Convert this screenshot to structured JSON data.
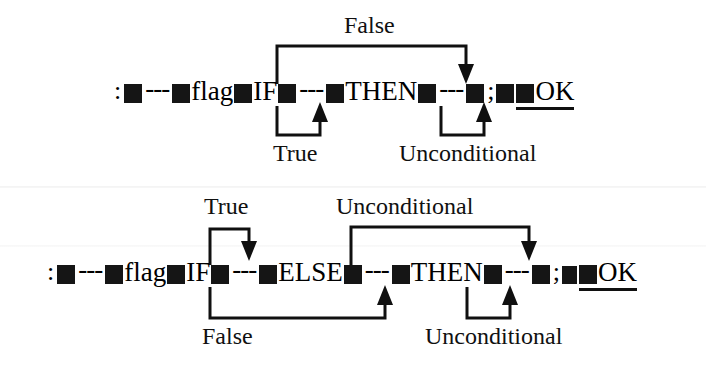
{
  "figure": {
    "kind": "forth-control-flow-diagram",
    "ink_color": "#101010",
    "background_color": "#ffffff"
  },
  "diagrams": [
    {
      "id": "if-then",
      "code_tokens": [
        {
          "type": "symbol",
          "text": ":"
        },
        {
          "type": "block",
          "text": ""
        },
        {
          "type": "dashes",
          "text": "---"
        },
        {
          "type": "block",
          "text": ""
        },
        {
          "type": "word",
          "text": "flag"
        },
        {
          "type": "block",
          "text": ""
        },
        {
          "type": "word",
          "text": "IF"
        },
        {
          "type": "block",
          "text": ""
        },
        {
          "type": "dashes",
          "text": "---"
        },
        {
          "type": "block",
          "text": ""
        },
        {
          "type": "word",
          "text": "THEN"
        },
        {
          "type": "block",
          "text": ""
        },
        {
          "type": "dashes",
          "text": "---"
        },
        {
          "type": "block",
          "text": ""
        },
        {
          "type": "symbol",
          "text": ";"
        },
        {
          "type": "block",
          "text": ""
        },
        {
          "type": "block",
          "text": ""
        },
        {
          "type": "word",
          "text": "OK"
        }
      ],
      "code_line_text": ": ■---■flag■IF■---■THEN■---■; ■ ■OK",
      "branches": [
        {
          "label": "False",
          "position": "above",
          "from": "after-IF",
          "to": "after-THEN",
          "direction": "forward-down-arrow"
        },
        {
          "label": "True",
          "position": "below",
          "from": "before-IF",
          "to": "after-IF",
          "direction": "forward-up-arrow"
        },
        {
          "label": "Unconditional",
          "position": "below",
          "from": "after-THEN",
          "to": "after-THEN-right",
          "direction": "forward-up-arrow"
        }
      ]
    },
    {
      "id": "if-else-then",
      "code_tokens": [
        {
          "type": "symbol",
          "text": ":"
        },
        {
          "type": "block",
          "text": ""
        },
        {
          "type": "dashes",
          "text": "---"
        },
        {
          "type": "block",
          "text": ""
        },
        {
          "type": "word",
          "text": "flag"
        },
        {
          "type": "block",
          "text": ""
        },
        {
          "type": "word",
          "text": "IF"
        },
        {
          "type": "block",
          "text": ""
        },
        {
          "type": "dashes",
          "text": "---"
        },
        {
          "type": "block",
          "text": ""
        },
        {
          "type": "word",
          "text": "ELSE"
        },
        {
          "type": "block",
          "text": ""
        },
        {
          "type": "dashes",
          "text": "---"
        },
        {
          "type": "block",
          "text": ""
        },
        {
          "type": "word",
          "text": "THEN"
        },
        {
          "type": "block",
          "text": ""
        },
        {
          "type": "dashes",
          "text": "---"
        },
        {
          "type": "block",
          "text": ""
        },
        {
          "type": "symbol",
          "text": ";"
        },
        {
          "type": "block",
          "text": ""
        },
        {
          "type": "block",
          "text": ""
        },
        {
          "type": "word",
          "text": "OK"
        }
      ],
      "code_line_text": ": ■---■flag■IF■---■ELSE■---■THEN■---■; ■ ■OK",
      "branches": [
        {
          "label": "True",
          "position": "above",
          "from": "before-IF",
          "to": "after-IF",
          "direction": "forward-down-arrow"
        },
        {
          "label": "Unconditional",
          "position": "above",
          "from": "after-ELSE",
          "to": "after-THEN",
          "direction": "forward-down-arrow"
        },
        {
          "label": "False",
          "position": "below",
          "from": "before-IF",
          "to": "after-ELSE",
          "direction": "forward-up-arrow"
        },
        {
          "label": "Unconditional",
          "position": "below",
          "from": "after-THEN",
          "to": "after-THEN-right",
          "direction": "forward-up-arrow"
        }
      ]
    }
  ],
  "labels": {
    "d1_false": "False",
    "d1_true": "True",
    "d1_uncond": "Unconditional",
    "d2_true": "True",
    "d2_uncond_top": "Unconditional",
    "d2_false": "False",
    "d2_uncond_bottom": "Unconditional"
  },
  "code": {
    "d1": {
      "colon": ":",
      "dash1": "---",
      "flag": "flag",
      "if": "IF",
      "dash2": "---",
      "then": "THEN",
      "dash3": "---",
      "semicolon": ";",
      "ok": "OK"
    },
    "d2": {
      "colon": ":",
      "dash1": "---",
      "flag": "flag",
      "if": "IF",
      "dash2": "---",
      "else": "ELSE",
      "dash3": "---",
      "then": "THEN",
      "dash4": "---",
      "semicolon": ";",
      "ok": "OK"
    }
  }
}
